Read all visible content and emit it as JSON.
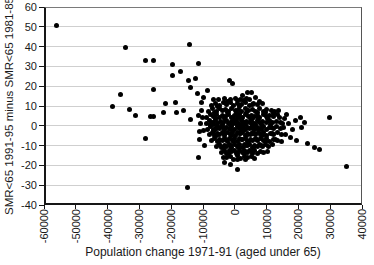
{
  "chart_data": {
    "type": "scatter",
    "title": "",
    "xlabel": "Population change 1971-91 (aged under 65)",
    "ylabel": "SMR<65 1991-95 minus SMR<65 1981-85",
    "xlim": [
      -60000,
      40000
    ],
    "ylim": [
      -40,
      60
    ],
    "x_ticks": [
      -60000,
      -50000,
      -40000,
      -30000,
      -20000,
      -10000,
      0,
      10000,
      20000,
      30000,
      40000
    ],
    "y_ticks": [
      -40,
      -30,
      -20,
      -10,
      0,
      10,
      20,
      30,
      40,
      50,
      60
    ],
    "grid": "horizontal-only",
    "legend": "none",
    "marker": {
      "shape": "circle",
      "color": "#000000",
      "size_px": 5
    },
    "colors": {
      "background": "#ffffff",
      "gridline": "#cfcfcf",
      "axis": "#161616",
      "text": "#1a1a1a",
      "marker": "#000000"
    },
    "points": [
      [
        -56000,
        50.5
      ],
      [
        -34500,
        39.5
      ],
      [
        -14400,
        41
      ],
      [
        -28000,
        33
      ],
      [
        -25500,
        33
      ],
      [
        -11300,
        31.5
      ],
      [
        -19500,
        31
      ],
      [
        -17000,
        27.5
      ],
      [
        -19700,
        25.5
      ],
      [
        -14500,
        23
      ],
      [
        -12400,
        24
      ],
      [
        -25700,
        18.5
      ],
      [
        -36000,
        16
      ],
      [
        -14000,
        19.5
      ],
      [
        -8700,
        18
      ],
      [
        -11700,
        16.5
      ],
      [
        -800,
        21.5
      ],
      [
        -1800,
        23
      ],
      [
        3900,
        17
      ],
      [
        6500,
        14.5
      ],
      [
        -33000,
        8.5
      ],
      [
        -38600,
        10
      ],
      [
        -31300,
        5
      ],
      [
        -26600,
        4.5
      ],
      [
        -25600,
        4.5
      ],
      [
        -22400,
        6.5
      ],
      [
        -21900,
        11.5
      ],
      [
        -18800,
        12
      ],
      [
        -18200,
        6.5
      ],
      [
        -16100,
        8
      ],
      [
        -14000,
        3
      ],
      [
        -28200,
        -6.5
      ],
      [
        -15000,
        -31
      ],
      [
        -11300,
        -16
      ],
      [
        35000,
        -20.5
      ],
      [
        29900,
        4.3
      ],
      [
        20700,
        4
      ],
      [
        23000,
        -9
      ],
      [
        26500,
        -12
      ],
      [
        24900,
        -11
      ],
      [
        800,
        -22
      ],
      [
        -1300,
        -19.4
      ],
      [
        -3400,
        -18.6
      ],
      [
        12300,
        6.3
      ],
      [
        7600,
        12.2
      ],
      [
        5600,
        11
      ],
      [
        2500,
        15.5
      ],
      [
        5300,
        16.8
      ],
      [
        4700,
        13.5
      ],
      [
        15500,
        3.7
      ],
      [
        16800,
        1
      ],
      [
        18200,
        -2
      ],
      [
        15800,
        -4.5
      ],
      [
        17500,
        -6
      ],
      [
        19500,
        -7.5
      ],
      [
        21000,
        -1
      ],
      [
        14800,
        -8
      ],
      [
        16200,
        5.5
      ],
      [
        13800,
        8
      ],
      [
        19000,
        2.5
      ],
      [
        22000,
        1.5
      ],
      [
        -11500,
        5
      ],
      [
        -10800,
        1
      ],
      [
        -11200,
        -3
      ],
      [
        -10400,
        8
      ],
      [
        -9800,
        -2.3
      ],
      [
        -10600,
        12
      ],
      [
        -9900,
        14.5
      ],
      [
        -11000,
        -7
      ],
      [
        -9600,
        -10
      ],
      [
        -10200,
        4
      ],
      [
        -5200,
        13.2
      ],
      [
        -3400,
        13.8
      ],
      [
        -1500,
        13.1
      ],
      [
        300,
        14
      ],
      [
        1900,
        13.4
      ],
      [
        3600,
        13.9
      ],
      [
        -6800,
        13.5
      ],
      [
        900,
        12.8
      ],
      [
        2800,
        12.6
      ],
      [
        -2300,
        12.4
      ],
      [
        -7400,
        10.4
      ],
      [
        -6100,
        11.2
      ],
      [
        -4800,
        10.1
      ],
      [
        -3700,
        11.6
      ],
      [
        -2600,
        10.7
      ],
      [
        -1400,
        11.9
      ],
      [
        -300,
        10.2
      ],
      [
        800,
        11.4
      ],
      [
        2100,
        10.9
      ],
      [
        3300,
        11.7
      ],
      [
        4600,
        10.3
      ],
      [
        5900,
        11.1
      ],
      [
        7200,
        10.6
      ],
      [
        8600,
        11.3
      ],
      [
        -5500,
        9.8
      ],
      [
        1600,
        9.9
      ],
      [
        -8200,
        7.4
      ],
      [
        -7000,
        8.6
      ],
      [
        -5900,
        7.1
      ],
      [
        -4900,
        8.9
      ],
      [
        -3900,
        7.7
      ],
      [
        -2900,
        8.2
      ],
      [
        -1900,
        7.3
      ],
      [
        -900,
        8.8
      ],
      [
        100,
        7.6
      ],
      [
        1100,
        8.4
      ],
      [
        2200,
        7.2
      ],
      [
        3200,
        8.7
      ],
      [
        4300,
        7.8
      ],
      [
        5400,
        8.3
      ],
      [
        6500,
        7.5
      ],
      [
        7700,
        8.9
      ],
      [
        8900,
        7.2
      ],
      [
        10100,
        8.5
      ],
      [
        11400,
        7.9
      ],
      [
        -6400,
        6.8
      ],
      [
        -2400,
        6.9
      ],
      [
        600,
        6.7
      ],
      [
        3800,
        6.6
      ],
      [
        7100,
        6.9
      ],
      [
        9500,
        6.5
      ],
      [
        12600,
        7.4
      ],
      [
        -8800,
        4.3
      ],
      [
        -7700,
        5.6
      ],
      [
        -6700,
        4.8
      ],
      [
        -5700,
        5.9
      ],
      [
        -4700,
        4.2
      ],
      [
        -3800,
        5.3
      ],
      [
        -2900,
        4.7
      ],
      [
        -2000,
        5.8
      ],
      [
        -1100,
        4.4
      ],
      [
        -200,
        5.2
      ],
      [
        700,
        4.9
      ],
      [
        1600,
        5.7
      ],
      [
        2500,
        4.1
      ],
      [
        3400,
        5.5
      ],
      [
        4300,
        4.6
      ],
      [
        5200,
        5.4
      ],
      [
        6100,
        4.8
      ],
      [
        7000,
        5.1
      ],
      [
        7900,
        4.3
      ],
      [
        8900,
        5.6
      ],
      [
        9900,
        4.5
      ],
      [
        11000,
        5.3
      ],
      [
        12100,
        4.8
      ],
      [
        13300,
        5.7
      ],
      [
        -6200,
        3.9
      ],
      [
        -3300,
        3.7
      ],
      [
        -500,
        3.8
      ],
      [
        2000,
        3.6
      ],
      [
        4800,
        3.9
      ],
      [
        7500,
        3.7
      ],
      [
        10400,
        3.8
      ],
      [
        1200,
        4.0
      ],
      [
        5700,
        3.5
      ],
      [
        13900,
        4.4
      ],
      [
        -9000,
        1.4
      ],
      [
        -8000,
        2.6
      ],
      [
        -7100,
        1.8
      ],
      [
        -6200,
        2.9
      ],
      [
        -5300,
        1.2
      ],
      [
        -4400,
        2.3
      ],
      [
        -3500,
        1.7
      ],
      [
        -2700,
        2.8
      ],
      [
        -1900,
        1.4
      ],
      [
        -1100,
        2.2
      ],
      [
        -300,
        1.9
      ],
      [
        500,
        2.7
      ],
      [
        1300,
        1.1
      ],
      [
        2100,
        2.5
      ],
      [
        2900,
        1.6
      ],
      [
        3700,
        2.4
      ],
      [
        4500,
        1.8
      ],
      [
        5300,
        2.1
      ],
      [
        6100,
        1.3
      ],
      [
        7000,
        2.6
      ],
      [
        7900,
        1.5
      ],
      [
        8800,
        2.3
      ],
      [
        9800,
        1.8
      ],
      [
        10800,
        2.7
      ],
      [
        11900,
        1.9
      ],
      [
        13100,
        2.4
      ],
      [
        14300,
        1.6
      ],
      [
        -6600,
        0.9
      ],
      [
        -3900,
        0.7
      ],
      [
        -1500,
        0.8
      ],
      [
        900,
        0.6
      ],
      [
        3300,
        0.9
      ],
      [
        5700,
        0.7
      ],
      [
        8300,
        0.8
      ],
      [
        11300,
        0.6
      ],
      [
        2500,
        1.0
      ],
      [
        6600,
        0.5
      ],
      [
        14900,
        1.2
      ],
      [
        -7600,
        0.8
      ],
      [
        -500,
        1.0
      ],
      [
        -8600,
        -1.6
      ],
      [
        -7600,
        -0.4
      ],
      [
        -6700,
        -1.9
      ],
      [
        -5800,
        -0.7
      ],
      [
        -4900,
        -1.2
      ],
      [
        -4100,
        -0.3
      ],
      [
        -3300,
        -1.8
      ],
      [
        -2500,
        -0.6
      ],
      [
        -1700,
        -1.3
      ],
      [
        -900,
        -0.2
      ],
      [
        -100,
        -1.7
      ],
      [
        700,
        -0.5
      ],
      [
        1500,
        -1.1
      ],
      [
        2300,
        -0.4
      ],
      [
        3100,
        -1.9
      ],
      [
        3900,
        -0.8
      ],
      [
        4700,
        -1.4
      ],
      [
        5500,
        -0.3
      ],
      [
        6300,
        -1.6
      ],
      [
        7100,
        -0.6
      ],
      [
        8000,
        -1.2
      ],
      [
        8900,
        -0.5
      ],
      [
        9900,
        -1.8
      ],
      [
        10900,
        -0.7
      ],
      [
        12000,
        -1.3
      ],
      [
        13200,
        -0.4
      ],
      [
        14400,
        -1.5
      ],
      [
        -6200,
        -2.0
      ],
      [
        -3700,
        -1.0
      ],
      [
        -1300,
        -2.0
      ],
      [
        1100,
        -1.0
      ],
      [
        3500,
        -2.0
      ],
      [
        5900,
        -1.0
      ],
      [
        8400,
        -2.0
      ],
      [
        11400,
        -1.0
      ],
      [
        1900,
        -0.1
      ],
      [
        5100,
        -0.9
      ],
      [
        15300,
        -0.8
      ],
      [
        -5400,
        -0.1
      ],
      [
        2700,
        -1.5
      ],
      [
        7500,
        -1.9
      ],
      [
        -8000,
        -4.6
      ],
      [
        -7100,
        -3.4
      ],
      [
        -6300,
        -4.9
      ],
      [
        -5500,
        -3.7
      ],
      [
        -4700,
        -4.2
      ],
      [
        -3900,
        -3.3
      ],
      [
        -3100,
        -4.8
      ],
      [
        -2300,
        -3.6
      ],
      [
        -1500,
        -4.3
      ],
      [
        -700,
        -3.2
      ],
      [
        100,
        -4.7
      ],
      [
        900,
        -3.5
      ],
      [
        1700,
        -4.1
      ],
      [
        2500,
        -3.4
      ],
      [
        3300,
        -4.9
      ],
      [
        4100,
        -3.8
      ],
      [
        4900,
        -4.4
      ],
      [
        5700,
        -3.3
      ],
      [
        6500,
        -4.6
      ],
      [
        7300,
        -3.6
      ],
      [
        8200,
        -4.2
      ],
      [
        9100,
        -3.5
      ],
      [
        10100,
        -4.8
      ],
      [
        11100,
        -3.7
      ],
      [
        12200,
        -4.3
      ],
      [
        13400,
        -3.4
      ],
      [
        -5900,
        -5.0
      ],
      [
        -3400,
        -4.0
      ],
      [
        -1000,
        -5.0
      ],
      [
        1400,
        -4.0
      ],
      [
        3800,
        -5.0
      ],
      [
        6200,
        -4.0
      ],
      [
        8700,
        -5.0
      ],
      [
        11700,
        -4.0
      ],
      [
        2200,
        -3.1
      ],
      [
        5400,
        -3.9
      ],
      [
        14600,
        -4.5
      ],
      [
        -6800,
        -3.1
      ],
      [
        -7300,
        -7.6
      ],
      [
        -6400,
        -6.4
      ],
      [
        -5600,
        -7.9
      ],
      [
        -4800,
        -6.7
      ],
      [
        -4000,
        -7.2
      ],
      [
        -3200,
        -6.3
      ],
      [
        -2400,
        -7.8
      ],
      [
        -1600,
        -6.6
      ],
      [
        -800,
        -7.3
      ],
      [
        0,
        -6.2
      ],
      [
        800,
        -7.7
      ],
      [
        1600,
        -6.5
      ],
      [
        2400,
        -7.1
      ],
      [
        3200,
        -6.4
      ],
      [
        4000,
        -7.9
      ],
      [
        4800,
        -6.8
      ],
      [
        5600,
        -7.4
      ],
      [
        6400,
        -6.3
      ],
      [
        7200,
        -7.6
      ],
      [
        8100,
        -6.6
      ],
      [
        9000,
        -7.2
      ],
      [
        10000,
        -6.5
      ],
      [
        11000,
        -7.8
      ],
      [
        12100,
        -6.7
      ],
      [
        13300,
        -7.3
      ],
      [
        -5200,
        -8.0
      ],
      [
        -2800,
        -7.0
      ],
      [
        -400,
        -8.0
      ],
      [
        2000,
        -7.0
      ],
      [
        4400,
        -8.0
      ],
      [
        6800,
        -7.0
      ],
      [
        9500,
        -8.0
      ],
      [
        12700,
        -7.0
      ],
      [
        -5800,
        -10.6
      ],
      [
        -4900,
        -9.4
      ],
      [
        -4100,
        -10.9
      ],
      [
        -3300,
        -9.7
      ],
      [
        -2500,
        -10.2
      ],
      [
        -1700,
        -9.3
      ],
      [
        -900,
        -10.8
      ],
      [
        -100,
        -9.6
      ],
      [
        700,
        -10.3
      ],
      [
        1500,
        -9.2
      ],
      [
        2300,
        -10.7
      ],
      [
        3100,
        -9.5
      ],
      [
        3900,
        -10.1
      ],
      [
        4700,
        -9.4
      ],
      [
        5500,
        -10.9
      ],
      [
        6300,
        -9.8
      ],
      [
        7100,
        -10.4
      ],
      [
        7900,
        -9.3
      ],
      [
        8800,
        -10.6
      ],
      [
        9700,
        -9.6
      ],
      [
        10700,
        -10.2
      ],
      [
        11800,
        -9.5
      ],
      [
        -3700,
        -11.0
      ],
      [
        -1300,
        -10.0
      ],
      [
        1100,
        -11.0
      ],
      [
        3500,
        -10.0
      ],
      [
        5900,
        -11.0
      ],
      [
        8300,
        -10.0
      ],
      [
        -4200,
        -13.6
      ],
      [
        -3300,
        -12.4
      ],
      [
        -2500,
        -13.9
      ],
      [
        -1700,
        -12.7
      ],
      [
        -900,
        -13.2
      ],
      [
        -100,
        -12.3
      ],
      [
        700,
        -13.8
      ],
      [
        1500,
        -12.6
      ],
      [
        2300,
        -13.3
      ],
      [
        3100,
        -12.2
      ],
      [
        3900,
        -13.7
      ],
      [
        4700,
        -12.5
      ],
      [
        5500,
        -13.1
      ],
      [
        6300,
        -12.4
      ],
      [
        7200,
        -13.9
      ],
      [
        8100,
        -12.8
      ],
      [
        9100,
        -13.4
      ],
      [
        -2100,
        -14.0
      ],
      [
        400,
        -14.0
      ],
      [
        2900,
        -14.0
      ],
      [
        5400,
        -14.0
      ],
      [
        10200,
        -12.9
      ],
      [
        -2600,
        -16.2
      ],
      [
        -1500,
        -15.4
      ],
      [
        -400,
        -16.8
      ],
      [
        700,
        -15.1
      ],
      [
        1800,
        -16.5
      ],
      [
        2900,
        -15.7
      ],
      [
        4000,
        -16.1
      ],
      [
        5100,
        -15.3
      ],
      [
        6200,
        -16.6
      ],
      [
        -3500,
        -15.8
      ],
      [
        3400,
        -17.0
      ],
      [
        900,
        -17.2
      ]
    ]
  }
}
